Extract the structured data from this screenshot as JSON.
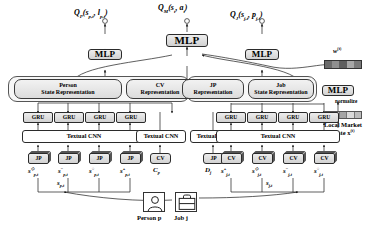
{
  "figure": {
    "type": "neural-network-architecture-diagram"
  },
  "outputs": {
    "q_person": "Qₚ(sₚ,ₜ, lₚ,ₜ)",
    "q_person_parts": {
      "head": "Q",
      "sub": "P",
      "args": "(s",
      "arg1sub": "p,t",
      "sep": ", l",
      "arg2sub": "p,t",
      "close": ")"
    },
    "q_market": "Qₘ(sₜ, aₜ)",
    "q_job": "Qⱼ(sⱼ,ₜ, pⱼ,ₜ)"
  },
  "mlp": {
    "label": "MLP",
    "top": "MLP",
    "left": "MLP",
    "right": "MLP",
    "market": "MLP"
  },
  "representations": [
    {
      "line1": "Person",
      "line2": "State Representation",
      "name": "person-state-representation"
    },
    {
      "line1": "CV",
      "line2": "Representation",
      "name": "cv-representation"
    },
    {
      "line1": "JP",
      "line2": "Representation",
      "name": "jp-representation"
    },
    {
      "line1": "Job",
      "line2": "State Representation",
      "name": "job-state-representation"
    }
  ],
  "gru": {
    "label": "GRU",
    "left_count": 4,
    "right_count": 4
  },
  "cnn": {
    "label": "Textual CNN",
    "count": 4
  },
  "doc_left": {
    "jp_label": "JP",
    "cv_label": "CV",
    "items": [
      {
        "base": "s",
        "sub": "p,t",
        "sup": "◇"
      },
      {
        "base": "s",
        "sub": "p,t",
        "sup": "−"
      },
      {
        "base": "s",
        "sub": "p,t",
        "sup": "○"
      },
      {
        "base": "s",
        "sub": "p,t",
        "sup": "+"
      }
    ],
    "cv_item": {
      "base": "C",
      "sub": "p",
      "sup": ""
    }
  },
  "doc_right": {
    "jp_label": "JP",
    "cv_label": "CV",
    "jp_item": {
      "base": "D",
      "sub": "j",
      "sup": ""
    },
    "items": [
      {
        "base": "s",
        "sub": "j,t",
        "sup": "+"
      },
      {
        "base": "s",
        "sub": "j,t",
        "sup": "◇"
      },
      {
        "base": "s",
        "sub": "j,t",
        "sup": "−"
      },
      {
        "base": "s",
        "sub": "j,t",
        "sup": "○"
      }
    ]
  },
  "aggregate": {
    "person_state": {
      "base": "s",
      "sub": "p,t"
    },
    "job_state": {
      "base": "s",
      "sub": "j,t"
    }
  },
  "market": {
    "weights_label": "w",
    "weights_sup": "(t)",
    "normalize": "normalize",
    "state_line1": "Local Market",
    "state_line2": "State x",
    "state_sup": "(t)"
  },
  "entities": {
    "person": "Person p",
    "job": "Job j",
    "person_icon": "person-avatar-icon",
    "job_icon": "briefcase-icon"
  },
  "colors": {
    "box_border": "#2b2b2b",
    "box_fill_top": "#ededed",
    "box_fill_bottom": "#d2d2d2",
    "panel_fill": "#f7f7f7",
    "heat_dark": "#6b6b6b",
    "heat_mid": "#9a9a9a",
    "heat_light": "#c9c9c9"
  }
}
